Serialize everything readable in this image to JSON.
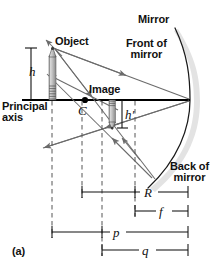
{
  "figure": {
    "panel_label": "(a)",
    "title_semantic": "concave-mirror-ray-diagram"
  },
  "labels": {
    "mirror": "Mirror",
    "front_of_mirror_line1": "Front of",
    "front_of_mirror_line2": "mirror",
    "back_of_mirror_line1": "Back of",
    "back_of_mirror_line2": "mirror",
    "object": "Object",
    "image": "Image",
    "principal_axis_line1": "Principal",
    "principal_axis_line2": "axis"
  },
  "symbols": {
    "object_height": "h",
    "image_height": "h′",
    "center_of_curvature": "C",
    "radius_of_curvature": "R",
    "focal_length": "f",
    "object_distance": "p",
    "image_distance": "q"
  },
  "colors": {
    "ink": "#111111",
    "ray": "#6b6b6b",
    "axis": "#000000",
    "object_body": "#b8b8b8",
    "object_edge": "#4a4a4a",
    "dashed": "#555555",
    "mirror_shadow": "#dedede",
    "background": "#ffffff"
  },
  "geometry": {
    "axis_y": 100,
    "axis_x_start": 22,
    "axis_x_end": 190,
    "mirror_vertex_x": 190,
    "object_base_x": 52,
    "object_tip_y": 48,
    "image_base_x": 112,
    "image_tip_y": 128,
    "center_of_curvature_x": 85,
    "focal_point_x": 137
  },
  "dimensions": [
    {
      "name": "R",
      "x_start": 82,
      "x_end": 188,
      "y": 192
    },
    {
      "name": "f",
      "x_start": 135,
      "x_end": 188,
      "y": 211
    },
    {
      "name": "p",
      "x_start": 52,
      "x_end": 188,
      "y": 232
    },
    {
      "name": "q",
      "x_start": 102,
      "x_end": 188,
      "y": 250
    }
  ],
  "rays": [
    {
      "name": "incident-ray-upper",
      "from": "object-tip",
      "to": "mirror-vertex"
    },
    {
      "name": "reflected-ray-lower-left",
      "from": "mirror-vertex",
      "to": "lower-left"
    },
    {
      "name": "incident-ray-through-center",
      "from": "object-tip",
      "to": "mirror-lower"
    },
    {
      "name": "reflected-ray-to-image",
      "from": "mirror-lower",
      "to": "image-tip"
    },
    {
      "name": "ray-back-to-object",
      "from": "image-region",
      "to": "object-tip"
    }
  ]
}
